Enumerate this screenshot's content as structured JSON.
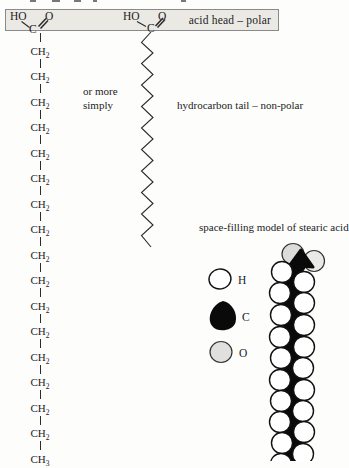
{
  "head_band": {
    "label": "acid head – polar"
  },
  "structural_formula": {
    "head": {
      "ho": "HO",
      "c": "C",
      "o": "O"
    },
    "chain": [
      {
        "f": "CH",
        "s": "2"
      },
      {
        "f": "CH",
        "s": "2"
      },
      {
        "f": "CH",
        "s": "2"
      },
      {
        "f": "CH",
        "s": "2"
      },
      {
        "f": "CH",
        "s": "2"
      },
      {
        "f": "CH",
        "s": "2"
      },
      {
        "f": "CH",
        "s": "2"
      },
      {
        "f": "CH",
        "s": "2"
      },
      {
        "f": "CH",
        "s": "2"
      },
      {
        "f": "CH",
        "s": "2"
      },
      {
        "f": "CH",
        "s": "2"
      },
      {
        "f": "CH",
        "s": "2"
      },
      {
        "f": "CH",
        "s": "2"
      },
      {
        "f": "CH",
        "s": "2"
      },
      {
        "f": "CH",
        "s": "2"
      },
      {
        "f": "CH",
        "s": "2"
      },
      {
        "f": "CH",
        "s": "3"
      }
    ]
  },
  "simplified_formula": {
    "caption_line1": "or more",
    "caption_line2": "simply",
    "head": {
      "ho": "HO",
      "c": "C",
      "o": "O"
    }
  },
  "tail_label": "hydrocarbon tail – non-polar",
  "space_filling": {
    "title": "space-filling model of stearic acid",
    "legend": [
      {
        "symbol": "H"
      },
      {
        "symbol": "C"
      },
      {
        "symbol": "O"
      }
    ]
  },
  "colors": {
    "band_fill": "#ebe9e4",
    "band_border": "#8a8a8a",
    "carbon": "#0a0a0a",
    "oxygen_fill": "#e0e0de",
    "hydrogen_fill": "#ffffff",
    "line": "#2b2b2b"
  }
}
